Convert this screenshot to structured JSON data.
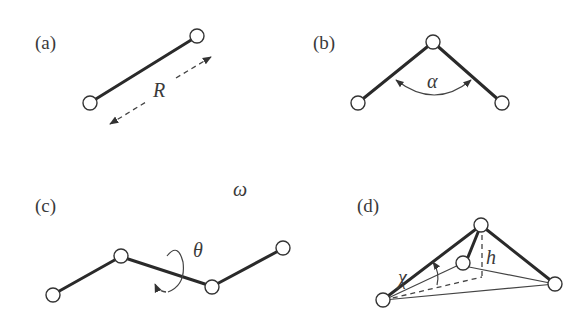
{
  "panels": {
    "a": {
      "label": "(a)",
      "symbol": "R",
      "description": "bond length"
    },
    "b": {
      "label": "(b)",
      "symbol": "α",
      "description": "bond angle"
    },
    "c": {
      "label": "(c)",
      "symbol": "θ",
      "extra_symbol": "ω",
      "description": "torsion / dihedral angle"
    },
    "d": {
      "label": "(d)",
      "symbol_angle": "χ",
      "symbol_height": "h",
      "description": "out-of-plane / inversion"
    }
  },
  "colors": {
    "line": "#2a2a2a",
    "text": "#3a3a3a",
    "atom_fill": "#ffffff"
  }
}
